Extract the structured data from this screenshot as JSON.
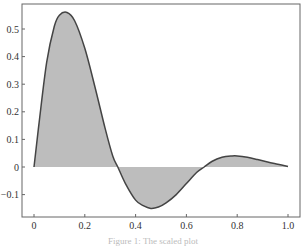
{
  "chart_data": {
    "type": "area",
    "title": "",
    "xlabel": "",
    "ylabel": "",
    "xlim": [
      0,
      1.0
    ],
    "ylim": [
      -0.18,
      0.59
    ],
    "grid": false,
    "legend": null,
    "x_ticks": [
      "0",
      "0.2",
      "0.4",
      "0.6",
      "0.8",
      "1.0"
    ],
    "y_ticks": [
      "-0.1",
      "0",
      "0.1",
      "0.2",
      "0.3",
      "0.4",
      "0.5"
    ],
    "series": [
      {
        "name": "curve",
        "fill_to_zero": true,
        "x": [
          0,
          0.02,
          0.05,
          0.08,
          0.1,
          0.13,
          0.16,
          0.2,
          0.24,
          0.28,
          0.31,
          0.33,
          0.36,
          0.4,
          0.43,
          0.46,
          0.49,
          0.52,
          0.56,
          0.6,
          0.64,
          0.67,
          0.7,
          0.74,
          0.78,
          0.8,
          0.84,
          0.88,
          0.92,
          0.96,
          1.0
        ],
        "y": [
          0,
          0.16,
          0.38,
          0.51,
          0.55,
          0.56,
          0.53,
          0.43,
          0.29,
          0.14,
          0.04,
          0.0,
          -0.06,
          -0.12,
          -0.14,
          -0.15,
          -0.145,
          -0.13,
          -0.1,
          -0.06,
          -0.02,
          0.0,
          0.02,
          0.035,
          0.04,
          0.04,
          0.035,
          0.027,
          0.018,
          0.01,
          0.002
        ]
      }
    ],
    "colors": {
      "line": "#444444",
      "fill": "#bdbdbd",
      "axes": "#555555"
    }
  },
  "caption": "Figure 1: The scaled plot"
}
